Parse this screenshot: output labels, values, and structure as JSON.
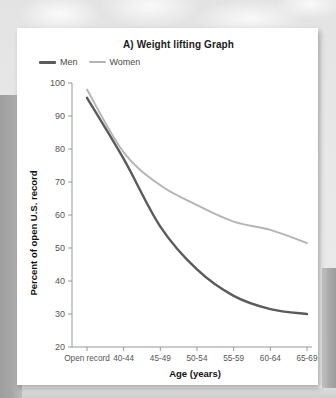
{
  "figure": {
    "title": "A) Weight lifting Graph"
  },
  "legend": {
    "position": "top-left",
    "items": [
      {
        "label": "Men",
        "color": "#5b5b5b"
      },
      {
        "label": "Women",
        "color": "#b4b4b4"
      }
    ]
  },
  "chart_data": {
    "type": "line",
    "title": "A) Weight lifting Graph",
    "xlabel": "Age (years)",
    "ylabel": "Percent of open U.S. record",
    "categories": [
      "Open record",
      "40-44",
      "45-49",
      "50-54",
      "55-59",
      "60-64",
      "65-69"
    ],
    "series": [
      {
        "name": "Men",
        "color": "#5b5b5b",
        "values": [
          95.5,
          77.0,
          56.5,
          43.5,
          35.5,
          31.5,
          30.0
        ]
      },
      {
        "name": "Women",
        "color": "#b4b4b4",
        "values": [
          98.0,
          79.0,
          69.0,
          63.0,
          58.0,
          55.5,
          51.5
        ]
      }
    ],
    "ylim": [
      20,
      100
    ],
    "yticks": [
      20,
      30,
      40,
      50,
      60,
      70,
      80,
      90,
      100
    ],
    "grid": false,
    "legend_position": "top-left"
  },
  "axes": {
    "x_title": "Age (years)",
    "y_title": "Percent of open U.S. record",
    "y_ticks": [
      "100",
      "90",
      "80",
      "70",
      "60",
      "50",
      "40",
      "30",
      "20"
    ],
    "x_ticks": [
      "Open record",
      "40-44",
      "45-49",
      "50-54",
      "55-59",
      "60-64",
      "65-69"
    ]
  }
}
